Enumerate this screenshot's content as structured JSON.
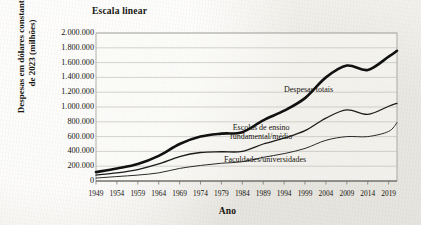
{
  "figure": {
    "title": "Escala linear",
    "x_axis_title": "Ano",
    "y_axis_title_line1": "Despesas em dólares constantes",
    "y_axis_title_line2": "de 2023 (milhões)"
  },
  "chart_data": {
    "type": "line",
    "title": "Escala linear",
    "xlabel": "Ano",
    "ylabel": "Despesas em dólares constantes de 2023 (milhões)",
    "xlim": [
      1949,
      2021
    ],
    "ylim": [
      0,
      2000000
    ],
    "grid": true,
    "legend_position": "inline-annotations",
    "y_tick_labels": [
      "2.000.000",
      "1.800.000",
      "1.600.000",
      "1.400.000",
      "1.200.000",
      "1.000.000",
      "800.000",
      "600.000",
      "400.000",
      "200.000",
      "0"
    ],
    "y_tick_values": [
      2000000,
      1800000,
      1600000,
      1400000,
      1200000,
      1000000,
      800000,
      600000,
      400000,
      200000,
      0
    ],
    "x_tick_labels": [
      "1949",
      "1954",
      "1959",
      "1964",
      "1969",
      "1974",
      "1979",
      "1984",
      "1989",
      "1994",
      "1999",
      "2004",
      "2009",
      "2014",
      "2019"
    ],
    "x_tick_values": [
      1949,
      1954,
      1959,
      1964,
      1969,
      1974,
      1979,
      1984,
      1989,
      1994,
      1999,
      2004,
      2009,
      2014,
      2019
    ],
    "x": [
      1949,
      1954,
      1959,
      1964,
      1969,
      1974,
      1979,
      1984,
      1989,
      1994,
      1999,
      2004,
      2009,
      2014,
      2019,
      2021
    ],
    "series": [
      {
        "name": "Despesas totais",
        "color": "#111111",
        "line_width": 2.6,
        "values": [
          120000,
          170000,
          230000,
          340000,
          500000,
          600000,
          640000,
          660000,
          820000,
          950000,
          1120000,
          1400000,
          1560000,
          1500000,
          1680000,
          1760000
        ]
      },
      {
        "name": "Escolas de ensino fundamental/médio",
        "color": "#1b1b1b",
        "line_width": 1.3,
        "values": [
          80000,
          110000,
          155000,
          230000,
          330000,
          385000,
          395000,
          400000,
          500000,
          580000,
          680000,
          850000,
          960000,
          900000,
          1010000,
          1050000
        ]
      },
      {
        "name": "Faculdades/universidades",
        "color": "#2a2a2a",
        "line_width": 1.0,
        "values": [
          40000,
          60000,
          80000,
          110000,
          170000,
          210000,
          240000,
          260000,
          320000,
          370000,
          440000,
          550000,
          600000,
          600000,
          670000,
          790000
        ]
      }
    ],
    "annotations": [
      {
        "text": "Despesas totais",
        "series": "Despesas totais"
      },
      {
        "text": "Escolas de ensino",
        "series": "Escolas de ensino fundamental/médio"
      },
      {
        "text": "fundamental/médio",
        "series": "Escolas de ensino fundamental/médio"
      },
      {
        "text": "Faculdades/universidades",
        "series": "Faculdades/universidades"
      }
    ]
  },
  "labels": {
    "total": "Despesas totais",
    "k12_line1": "Escolas de ensino",
    "k12_line2": "fundamental/médio",
    "college": "Faculdades/universidades"
  },
  "colors": {
    "paper": "#f3f1ec",
    "ink": "#17150f",
    "grid": "#b9b7b1",
    "axis": "#8f8d87"
  }
}
